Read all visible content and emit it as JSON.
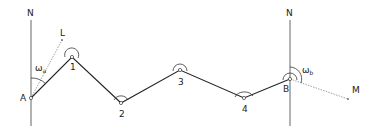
{
  "diagram": {
    "type": "traverse-survey",
    "north_label_left": "N",
    "north_label_right": "N",
    "start_point": "A",
    "end_point": "B",
    "stations": [
      "1",
      "2",
      "3",
      "4"
    ],
    "back_sight_label": "L",
    "fore_sight_label": "M",
    "angle_a_symbol": "ω",
    "angle_a_subscript": "a",
    "angle_b_symbol": "ω",
    "angle_b_subscript": "b",
    "colors": {
      "traverse_line": "#222222",
      "north_line": "#555555",
      "sight_line": "#999999"
    }
  }
}
